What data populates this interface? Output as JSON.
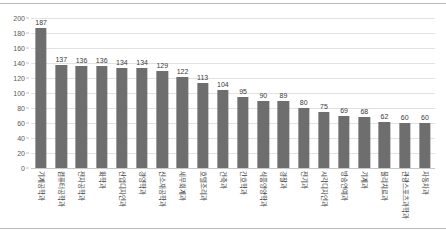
{
  "chart_data": {
    "type": "bar",
    "title": "",
    "xlabel": "",
    "ylabel": "",
    "ylim": [
      0,
      200
    ],
    "ytick_step": 20,
    "yticks": [
      0,
      20,
      40,
      60,
      80,
      100,
      120,
      140,
      160,
      180,
      200
    ],
    "grid": true,
    "legend": "none",
    "orientation": "vertical",
    "bar_color": "#6e6e6e",
    "gridline_color": "#e2e2e2",
    "background_color": "#ffffff",
    "categories": [
      "기계공학과",
      "컴퓨터공학과",
      "전자공학과",
      "화학과",
      "산업디자인과",
      "경영학과",
      "신소재공학과",
      "세무회계과",
      "호텔조리과",
      "건축과",
      "간호학과",
      "식품영양학과",
      "경찰과",
      "전기과",
      "시각디자인과",
      "방송연예과",
      "기계과",
      "물리치료과",
      "관광스포츠과학과",
      "자동차과"
    ],
    "values": [
      187,
      137,
      136,
      136,
      134,
      134,
      129,
      122,
      113,
      104,
      95,
      90,
      89,
      80,
      75,
      69,
      68,
      62,
      60,
      60
    ],
    "data_labels": [
      "187",
      "137",
      "136",
      "136",
      "134",
      "134",
      "129",
      "122",
      "113",
      "104",
      "95",
      "90",
      "89",
      "80",
      "75",
      "69",
      "68",
      "62",
      "60",
      "60"
    ]
  }
}
